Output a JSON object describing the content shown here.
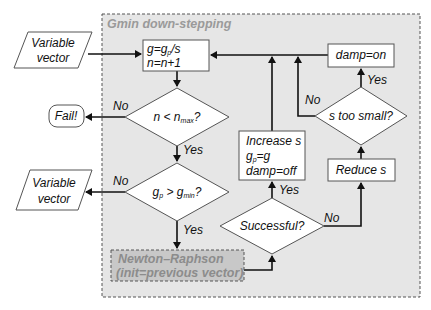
{
  "diagram": {
    "group": {
      "title": "Gmin down-stepping",
      "fill": "#e6e6e6",
      "border": "#555555"
    },
    "inputs": {
      "top_vector": [
        "Variable",
        "vector"
      ],
      "bottom_vector": [
        "Variable",
        "vector"
      ]
    },
    "terminals": {
      "fail": "Fail!"
    },
    "processes": {
      "update_g": {
        "line1": "g=g",
        "line1_sub": "p",
        "line1_tail": "/s",
        "line2": "n=n+1"
      },
      "newton": {
        "line1": "Newton–Raphson",
        "line2": "(init=previous vector)",
        "fill": "#c8c8c8"
      },
      "increase": {
        "line1": "Increase s",
        "line2": "g",
        "line2_sub": "p",
        "line2_tail": "=g",
        "line3": "damp=off"
      },
      "reduce": "Reduce s",
      "damp_on": "damp=on"
    },
    "decisions": {
      "n_check": {
        "pre": "n < n",
        "sub": "max",
        "post": "?"
      },
      "g_check": {
        "pre": "g",
        "sub1": "p",
        "mid": " > g",
        "sub2": "min",
        "post": "?"
      },
      "successful": "Successful?",
      "s_small": "s too small?"
    },
    "edge_labels": {
      "yes": "Yes",
      "no": "No"
    }
  }
}
